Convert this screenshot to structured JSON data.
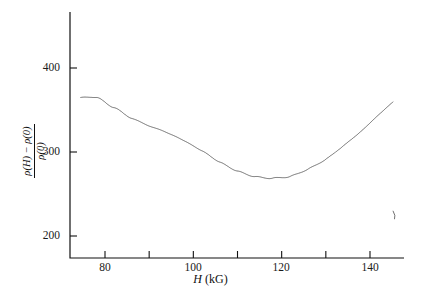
{
  "figure": {
    "kind": "scientific-plot",
    "background": "#ffffff",
    "ink_color": "#111111"
  },
  "axes": {
    "x_title_symbol": "H",
    "x_title_unit": "(kG)",
    "y_title_numerator": "ρ(H) − ρ(0)",
    "y_title_denominator": "ρ(0)",
    "x_ticks_major": [
      "80",
      "100",
      "120",
      "140"
    ],
    "x_ticks_minor": [
      "90",
      "110",
      "130"
    ],
    "y_ticks_major": [
      "400",
      "300",
      "200"
    ]
  },
  "chart_data": {
    "type": "line",
    "title": "",
    "xlabel": "H (kG)",
    "ylabel": "[ρ(H) − ρ(0)] / ρ(0)",
    "xlim": [
      73,
      147
    ],
    "ylim": [
      185,
      470
    ],
    "xticks": [
      80,
      90,
      100,
      110,
      120,
      130,
      140
    ],
    "xticklabels": [
      "80",
      "",
      "100",
      "",
      "120",
      "",
      "140"
    ],
    "yticks": [
      200,
      300,
      400
    ],
    "yticklabels": [
      "200",
      "300",
      "400"
    ],
    "grid": false,
    "legend": null,
    "series": [
      {
        "name": "magnetoresistance oscillations",
        "color": "#111111",
        "linewidth": 0.6,
        "description": "Shubnikov-de Haas oscillations periodic in 1/H superposed on a smooth background; amplitude grows strongly with field.",
        "x_start": 74.5,
        "x_end": 145.2,
        "oscillation": {
          "periodic_in": "1/H",
          "frequency_tesla": 1340,
          "phase_offset": 0.3
        },
        "background_envelope": {
          "comment": "smooth mean level of the oscillating trace, read at the listed fields",
          "x": [
            74.5,
            78,
            82,
            86,
            90,
            94,
            98,
            102,
            106,
            110,
            114,
            118,
            122,
            126,
            130,
            134,
            138,
            142,
            145.2
          ],
          "y": [
            356,
            352,
            340,
            330,
            326,
            327,
            330,
            333,
            334,
            335,
            336,
            337,
            337,
            338,
            338,
            339,
            339,
            340,
            340
          ]
        },
        "amplitude_envelope": {
          "comment": "half peak-to-peak amplitude of the oscillation at the listed fields",
          "x": [
            74.5,
            78,
            82,
            86,
            90,
            94,
            98,
            102,
            106,
            110,
            114,
            118,
            122,
            126,
            130,
            134,
            138,
            142,
            145.2
          ],
          "y": [
            11,
            13,
            14,
            16,
            20,
            26,
            34,
            42,
            50,
            58,
            66,
            74,
            82,
            89,
            96,
            102,
            108,
            113,
            116
          ]
        },
        "peak_values_sample": {
          "comment": "approximate maxima of the trace at selected fields",
          "x": [
            76,
            84,
            92,
            100,
            108,
            116,
            124,
            132,
            140,
            144
          ],
          "y": [
            366,
            354,
            347,
            365,
            385,
            404,
            419,
            433,
            446,
            454
          ]
        },
        "trough_values_sample": {
          "comment": "approximate minima of the trace at selected fields",
          "x": [
            76,
            84,
            92,
            100,
            108,
            116,
            124,
            132,
            140,
            144
          ],
          "y": [
            344,
            326,
            307,
            297,
            285,
            265,
            252,
            240,
            228,
            224
          ]
        },
        "end_marker": "short downward hook at the right end of the trace near H = 145"
      }
    ]
  }
}
